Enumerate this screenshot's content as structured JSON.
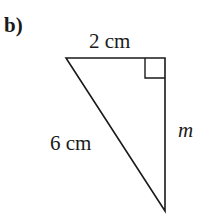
{
  "part_label": "b)",
  "triangle": {
    "top_side_label": "2 cm",
    "hypotenuse_label": "6 cm",
    "vertical_side_label": "m",
    "right_angle_marker": true,
    "vertices": {
      "top_left": [
        66,
        58
      ],
      "right_angle": [
        165,
        58
      ],
      "bottom": [
        165,
        211
      ]
    }
  },
  "colors": {
    "line": "#1a1a1a",
    "background": "#ffffff"
  }
}
